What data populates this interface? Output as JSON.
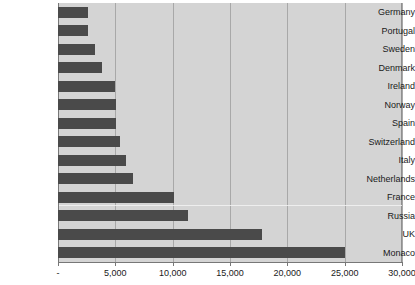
{
  "chart_data": {
    "type": "bar",
    "orientation": "horizontal",
    "title": "",
    "subtitle": "",
    "xlabel": "",
    "ylabel": "",
    "categories": [
      "Germany",
      "Portugal",
      "Sweden",
      "Denmark",
      "Ireland",
      "Norway",
      "Spain",
      "Switzerland",
      "Italy",
      "Netherlands",
      "France",
      "Russia",
      "UK",
      "Monaco"
    ],
    "values": [
      2600,
      2600,
      3200,
      3850,
      5000,
      5050,
      5100,
      5400,
      5950,
      6550,
      10150,
      11350,
      17800,
      25000
    ],
    "xlim": [
      0,
      30000
    ],
    "xticks": [
      0,
      5000,
      10000,
      15000,
      20000,
      25000,
      30000
    ],
    "xticklabels": [
      "-",
      "5,000",
      "10,000",
      "15,000",
      "20,000",
      "25,000",
      "30,000"
    ],
    "grid": true,
    "grid_axis": "x",
    "legend": null,
    "legend_position": "none",
    "bar_color": "#4a4a4a",
    "plot_background": "#d4d4d4",
    "figure_background": "#ffffff",
    "gridline_color": "#a8a8a8",
    "axis_color": "#777777",
    "text_color": "#1a1a1a"
  }
}
